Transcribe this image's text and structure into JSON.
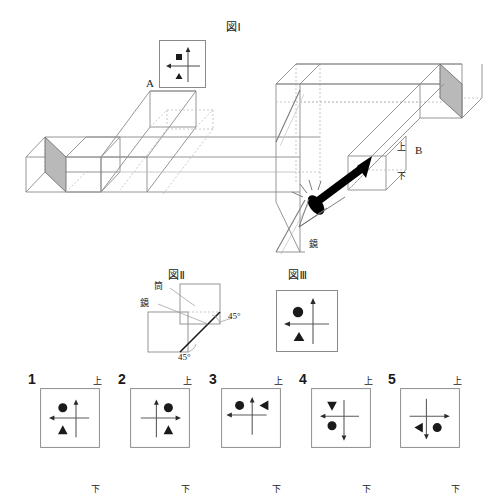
{
  "figures": {
    "fig1": {
      "title": "図Ⅰ",
      "labels": {
        "a": "A",
        "b": "B",
        "up": "上",
        "down": "下",
        "mirror": "鏡"
      },
      "icons": {
        "eye": "eye-icon",
        "arrow": "viewing-direction-arrow",
        "mirror_face_left": "mirror-surface-left",
        "mirror_face_right": "mirror-surface-right"
      },
      "marker_box": {
        "name": "object-marker-box",
        "axes": {
          "vertical_arrow": "up",
          "horizontal_arrow": "left"
        },
        "marks": [
          {
            "shape": "square",
            "quadrant": "upper-left"
          },
          {
            "shape": "triangle",
            "quadrant": "lower-left"
          }
        ]
      }
    },
    "fig2": {
      "title": "図Ⅱ",
      "labels": {
        "tube": "筒",
        "mirror": "鏡",
        "angle_right": "45°",
        "angle_bottom": "45°"
      }
    },
    "fig3": {
      "title": "図Ⅲ",
      "box": {
        "name": "fig3-marker-box",
        "axes": {
          "vertical_arrow": "up",
          "horizontal_arrow": "left"
        },
        "marks": [
          {
            "shape": "circle",
            "quadrant": "upper-left"
          },
          {
            "shape": "triangle-up",
            "quadrant": "lower-left"
          }
        ]
      }
    }
  },
  "options": [
    {
      "number": "1",
      "up": "上",
      "down": "下",
      "axes": {
        "vertical_arrow": "up",
        "horizontal_arrow": "left"
      },
      "cross": {
        "cx": 60,
        "cy": 50
      },
      "marks": [
        {
          "shape": "circle",
          "x": 38,
          "y": 33
        },
        {
          "shape": "triangle-up",
          "x": 38,
          "y": 70
        }
      ]
    },
    {
      "number": "2",
      "up": "上",
      "down": "下",
      "axes": {
        "vertical_arrow": "up",
        "horizontal_arrow": "right"
      },
      "cross": {
        "cx": 44,
        "cy": 50
      },
      "marks": [
        {
          "shape": "circle",
          "x": 64,
          "y": 33
        },
        {
          "shape": "triangle-up",
          "x": 64,
          "y": 70
        }
      ]
    },
    {
      "number": "3",
      "up": "上",
      "down": "下",
      "axes": {
        "vertical_arrow": "up",
        "horizontal_arrow": "left"
      },
      "cross": {
        "cx": 52,
        "cy": 45
      },
      "marks": [
        {
          "shape": "circle",
          "x": 31,
          "y": 29
        },
        {
          "shape": "triangle-left",
          "x": 72,
          "y": 29
        }
      ]
    },
    {
      "number": "4",
      "up": "上",
      "down": "下",
      "axes": {
        "vertical_arrow": "down",
        "horizontal_arrow": "left"
      },
      "cross": {
        "cx": 55,
        "cy": 47
      },
      "marks": [
        {
          "shape": "triangle-down",
          "x": 35,
          "y": 28
        },
        {
          "shape": "circle",
          "x": 35,
          "y": 63
        }
      ]
    },
    {
      "number": "5",
      "up": "上",
      "down": "下",
      "axes": {
        "vertical_arrow": "down",
        "horizontal_arrow": "right"
      },
      "cross": {
        "cx": 44,
        "cy": 47
      },
      "marks": [
        {
          "shape": "triangle-right",
          "x": 28,
          "y": 66
        },
        {
          "shape": "circle",
          "x": 62,
          "y": 66
        }
      ]
    }
  ],
  "colors": {
    "ink": "#1a1a1a",
    "line": "#8a8a8a",
    "line_dark": "#6f6f6f",
    "mirror_fill": "#b9b9b9",
    "dash": "#c2c2c2"
  }
}
